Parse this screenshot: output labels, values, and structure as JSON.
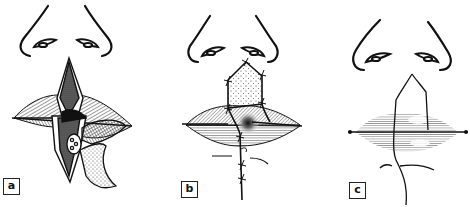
{
  "figure": {
    "panels": [
      {
        "id": "a",
        "label": "a"
      },
      {
        "id": "b",
        "label": "b"
      },
      {
        "id": "c",
        "label": "c"
      }
    ],
    "colors": {
      "ink": "#111111",
      "background": "#ffffff",
      "hatch": "#555555",
      "stipple": "#777777"
    }
  }
}
